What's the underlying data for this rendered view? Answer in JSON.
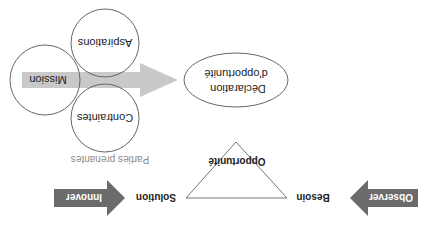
{
  "diagram": {
    "orientation": "rotated 180 degrees",
    "flow": {
      "observer_label": "Observer",
      "besoin_label": "Besoin",
      "opportunite_label": "Opportunité",
      "solution_label": "Solution",
      "innover_label": "Innover",
      "parties_prenantes_label": "Parties prenantes"
    },
    "circles": {
      "aspirations_label": "Aspirations",
      "mission_label": "Mission",
      "contraintes_label": "Contraintes"
    },
    "declaration": {
      "line1": "Déclaration",
      "line2": "d'opportunité"
    },
    "colors": {
      "dark_arrow": "#6b6b6b",
      "light_arrow": "#c9c9c9",
      "outline": "#555555",
      "text": "#222222",
      "muted_text": "#8a8a8a"
    }
  }
}
